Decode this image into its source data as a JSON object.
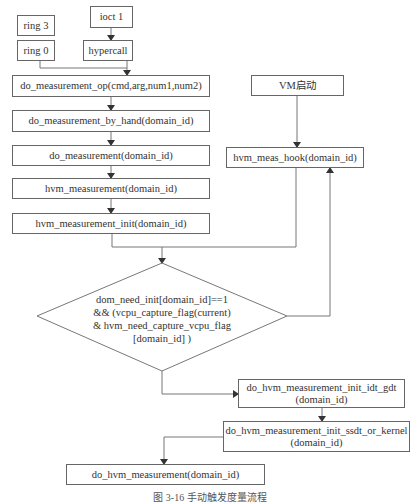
{
  "nodes": {
    "ring3": "ring 3",
    "ring0": "ring 0",
    "ioctl": "ioct 1",
    "hypercall": "hypercall",
    "do_measurement_op": "do_measurement_op(cmd,arg,num1,num2)",
    "do_measurement_by_hand": "do_measurement_by_hand(domain_id)",
    "do_measurement": "do_measurement(domain_id)",
    "hvm_measurement": "hvm_measurement(domain_id)",
    "hvm_measurement_init": "hvm_measurement_init(domain_id)",
    "vm_start": "VM启动",
    "hvm_meas_hook": "hvm_meas_hook(domain_id)",
    "decision": {
      "line1": "dom_need_init[domain_id]==1",
      "line2": "&&  (vcpu_capture_flag(current)",
      "line3": "& hvm_need_capture_vcpu_flag",
      "line4": "[domain_id] )"
    },
    "init_idt_gdt": {
      "line1": "do_hvm_measurement_init_idt_gdt",
      "line2": "(domain_id)"
    },
    "init_ssdt_or_kernel": {
      "line1": "do_hvm_measurement_init_ssdt_or_kernel",
      "line2": "(domain_id)"
    },
    "do_hvm_measurement": "do_hvm_measurement(domain_id)"
  },
  "caption": "图 3-16   手动触发度量流程"
}
